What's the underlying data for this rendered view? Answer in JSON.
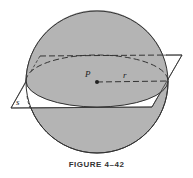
{
  "figure": {
    "caption": "FIGURE 4–42",
    "labels": {
      "center": "P",
      "radius": "r",
      "plane": "s"
    },
    "colors": {
      "sphere_fill": "#b4b4b4",
      "outline": "#333333",
      "plane_fill": "#ffffff",
      "background": "#ffffff"
    }
  }
}
